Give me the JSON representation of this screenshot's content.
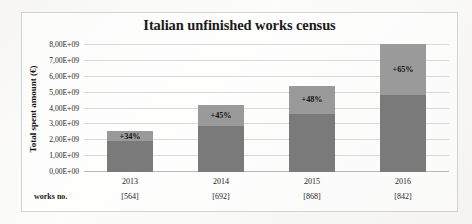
{
  "chart_data": {
    "type": "bar",
    "title": "Italian unfinished works census",
    "xlabel": "",
    "ylabel": "Total spent amount (€)",
    "categories": [
      "2013",
      "2014",
      "2015",
      "2016"
    ],
    "ylim": [
      0,
      8000000000
    ],
    "ytick_labels": [
      "0,00E+00",
      "1,00E+09",
      "2,00E+09",
      "3,00E+09",
      "4,00E+09",
      "5,00E+09",
      "6,00E+09",
      "7,00E+09",
      "8,00E+09"
    ],
    "ytick_values": [
      0,
      1000000000,
      2000000000,
      3000000000,
      4000000000,
      5000000000,
      6000000000,
      7000000000,
      8000000000
    ],
    "grid": true,
    "legend": "none",
    "stacked": true,
    "series": [
      {
        "name": "base amount",
        "color": "#7a7a7a",
        "values": [
          1930000000,
          2930000000,
          3670000000,
          4880000000
        ]
      },
      {
        "name": "increase",
        "color": "#9a9a9a",
        "values": [
          650000000,
          1320000000,
          1780000000,
          3170000000
        ]
      }
    ],
    "totals": [
      2580000000,
      4250000000,
      5450000000,
      8050000000
    ],
    "annotations": [
      "+34%",
      "+45%",
      "+48%",
      "+65%"
    ],
    "secondary_axis_caption": "works no.",
    "secondary_axis_values": [
      "[564]",
      "[692]",
      "[868]",
      "[842]"
    ]
  }
}
